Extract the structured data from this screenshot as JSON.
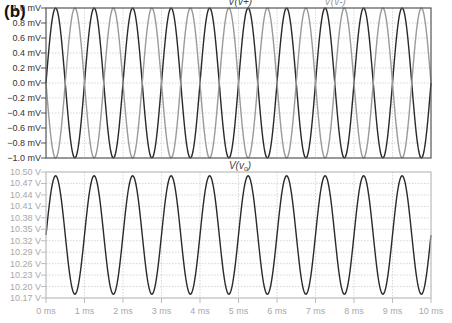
{
  "figure": {
    "panel_label": "(b)"
  },
  "colors": {
    "dark_trace": "#2a2a2a",
    "light_trace": "#9a9a9a",
    "frame_top": "#555555",
    "frame_bottom": "#bbbbbb",
    "grid": "#cccccc",
    "tick_label_top": "#333333",
    "tick_label_bottom": "#a8a8a8"
  },
  "chart_data": [
    {
      "type": "line",
      "title": "",
      "xlabel": "",
      "ylabel": "",
      "xlim": [
        0,
        10
      ],
      "ylim": [
        -1.0,
        1.0
      ],
      "x_unit": "ms",
      "y_unit": "mV",
      "yticks": [
        "1.0 mV",
        "0.8 mV",
        "0.6 mV",
        "0.4 mV",
        "0.2 mV",
        "0.0 mV",
        "-0.2 mV",
        "-0.4 mV",
        "-0.6 mV",
        "-0.8 mV",
        "-1.0 mV"
      ],
      "grid": true,
      "series": [
        {
          "name": "V(v+)",
          "shape": "sine",
          "amplitude": 1.0,
          "offset": 0.0,
          "frequency_khz": 1.0,
          "phase_deg": 0,
          "style": "dark"
        },
        {
          "name": "V(v-)",
          "shape": "sine",
          "amplitude": 1.0,
          "offset": 0.0,
          "frequency_khz": 1.0,
          "phase_deg": 180,
          "style": "light"
        }
      ],
      "legend": [
        {
          "label": "V(v+)",
          "position": "top-center"
        },
        {
          "label": "V(v-)",
          "position": "top-right"
        }
      ]
    },
    {
      "type": "line",
      "title": "",
      "xlabel": "",
      "ylabel": "",
      "xlim": [
        0,
        10
      ],
      "ylim": [
        10.17,
        10.5
      ],
      "x_unit": "ms",
      "y_unit": "V",
      "xticks": [
        "0 ms",
        "1 ms",
        "2 ms",
        "3 ms",
        "4 ms",
        "5 ms",
        "6 ms",
        "7 ms",
        "8 ms",
        "9 ms",
        "10 ms"
      ],
      "yticks": [
        "10.50 V",
        "10.47 V",
        "10.44 V",
        "10.41 V",
        "10.38 V",
        "10.35 V",
        "10.32 V",
        "10.29 V",
        "10.26 V",
        "10.23 V",
        "10.20 V",
        "10.17 V"
      ],
      "grid": true,
      "series": [
        {
          "name": "V(vo)",
          "shape": "sine",
          "amplitude": 0.155,
          "offset": 10.335,
          "frequency_khz": 1.0,
          "phase_deg": 0,
          "style": "dark"
        }
      ],
      "legend": [
        {
          "label": "V(vo)",
          "position": "top-center"
        }
      ]
    }
  ]
}
